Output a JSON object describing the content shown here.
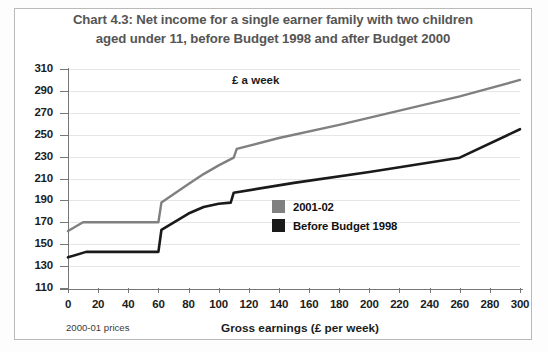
{
  "figure": {
    "title": "Chart 4.3: Net income for a single earner family with two children aged under 11, before Budget 1998 and after Budget 2000",
    "title_line1": "Chart 4.3: Net income for a single earner family with two children",
    "title_line2": "aged under 11, before Budget 1998 and after Budget 2000",
    "note": "2000-01 prices",
    "inplot_axis_label": "£ a week",
    "xlabel": "Gross earnings (£ per week)"
  },
  "colors": {
    "series_2001_02": "#808080",
    "series_before_1998": "#1a1a1a",
    "title": "#555555",
    "grid": "#e6e6e6",
    "axis": "#767676",
    "frame": "#b9b9b9",
    "background": "#ffffff"
  },
  "legend": {
    "position": "inside-center-right",
    "items": [
      {
        "label": "2001-02",
        "color": "#808080"
      },
      {
        "label": "Before Budget 1998",
        "color": "#1a1a1a"
      }
    ]
  },
  "axes": {
    "y_ticks": [
      110,
      130,
      150,
      170,
      190,
      210,
      230,
      250,
      270,
      290,
      310
    ],
    "x_ticks": [
      0,
      20,
      40,
      60,
      80,
      100,
      120,
      140,
      160,
      180,
      200,
      220,
      240,
      260,
      280,
      300
    ],
    "ylim": [
      110,
      310
    ],
    "xlim": [
      0,
      300
    ],
    "grid": "horizontal"
  },
  "chart_data": {
    "type": "line",
    "title": "Chart 4.3: Net income for a single earner family with two children aged under 11, before Budget 1998 and after Budget 2000",
    "xlabel": "Gross earnings (£ per week)",
    "ylabel": "£ a week",
    "xlim": [
      0,
      300
    ],
    "ylim": [
      110,
      310
    ],
    "grid": true,
    "legend_position": "inside-center-right",
    "annotations": [
      "2000-01 prices",
      "£ a week"
    ],
    "series": [
      {
        "name": "2001-02",
        "color": "#808080",
        "points": [
          [
            0,
            162
          ],
          [
            10,
            170
          ],
          [
            60,
            170
          ],
          [
            62,
            188
          ],
          [
            80,
            205
          ],
          [
            90,
            214
          ],
          [
            100,
            222
          ],
          [
            110,
            229
          ],
          [
            112,
            237
          ],
          [
            140,
            247
          ],
          [
            180,
            259
          ],
          [
            220,
            272
          ],
          [
            260,
            285
          ],
          [
            300,
            300
          ]
        ]
      },
      {
        "name": "Before Budget 1998",
        "color": "#1a1a1a",
        "points": [
          [
            0,
            138
          ],
          [
            12,
            143
          ],
          [
            60,
            143
          ],
          [
            62,
            163
          ],
          [
            80,
            178
          ],
          [
            90,
            184
          ],
          [
            100,
            187
          ],
          [
            108,
            188
          ],
          [
            110,
            197
          ],
          [
            150,
            206
          ],
          [
            200,
            216
          ],
          [
            260,
            229
          ],
          [
            300,
            255
          ]
        ]
      }
    ]
  }
}
